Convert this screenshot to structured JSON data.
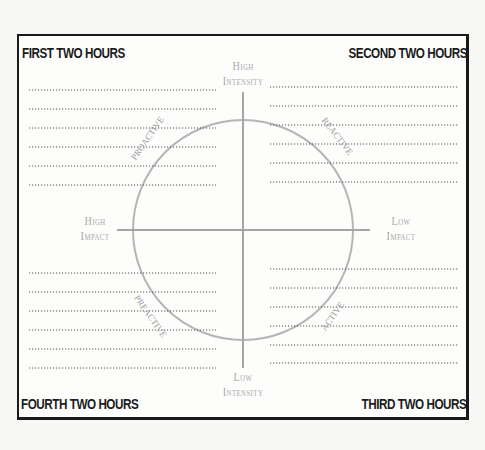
{
  "corners": {
    "top_left": "FIRST TWO HOURS",
    "top_right": "SECOND TWO HOURS",
    "bottom_right": "THIRD TWO HOURS",
    "bottom_left": "FOURTH TWO HOURS"
  },
  "axes": {
    "top": {
      "line1": "High",
      "line2": "Intensity"
    },
    "bottom": {
      "line1": "Low",
      "line2": "Intensity"
    },
    "left": {
      "line1": "High",
      "line2": "Impact"
    },
    "right": {
      "line1": "Low",
      "line2": "Impact"
    }
  },
  "quadrant_labels": {
    "top_left": "PROACTIVE",
    "top_right": "REACTIVE",
    "bottom_right": "ACTIVE",
    "bottom_left": "PREACTIVE"
  },
  "colors": {
    "frame": "#1a1a1a",
    "axis_gray": "#a8a8a8",
    "dotted_line": "#555555"
  },
  "lines_per_quadrant": 6
}
